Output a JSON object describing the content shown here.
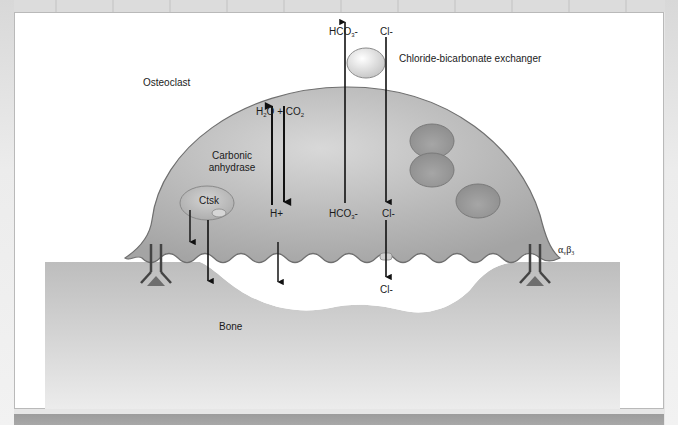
{
  "labels": {
    "osteoclast": "Osteoclast",
    "bone": "Bone",
    "carbonic_anhydrase_line1": "Carbonic",
    "carbonic_anhydrase_line2": "anhydrase",
    "ctsk": "Ctsk",
    "exchanger": "Chloride-bicarbonate exchanger",
    "reaction": {
      "h": "H",
      "two": "2",
      "o_plus": "O + CO",
      "co2_sub": "2"
    },
    "h_plus": "H+",
    "hco3_top": {
      "base": "HCO",
      "sub": "3",
      "charge": "-"
    },
    "hco3_inside": {
      "base": "HCO",
      "sub": "3",
      "charge": "-"
    },
    "cl_top": "Cl-",
    "cl_inside": "Cl-",
    "cl_bottom": "Cl-",
    "integrin": {
      "alpha": "α",
      "v": "v",
      "beta": "β",
      "three": "3"
    }
  },
  "colors": {
    "cell_fill": "#b4b4b4",
    "cell_outline": "#6f6f6f",
    "bone_fill": "#c8c8c8",
    "nucleus_fill": "#9a9a9a",
    "integrin_triangle": "#7a7a7a",
    "arrow": "#111111",
    "panel_bg": "#ffffff"
  }
}
